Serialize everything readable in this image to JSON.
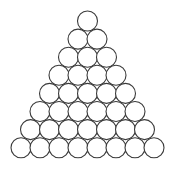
{
  "diagram": {
    "type": "triangular-circle-packing",
    "rows": 8,
    "circles_per_row": [
      1,
      2,
      3,
      4,
      5,
      6,
      7,
      8
    ],
    "total_circles": 36,
    "circle": {
      "radius": 10,
      "fill": "#ffffff",
      "stroke": "#3a3a3a"
    },
    "layout": {
      "apex_x": 87.5,
      "apex_y": 21,
      "h_spacing": 19,
      "v_spacing": 18.1
    }
  }
}
